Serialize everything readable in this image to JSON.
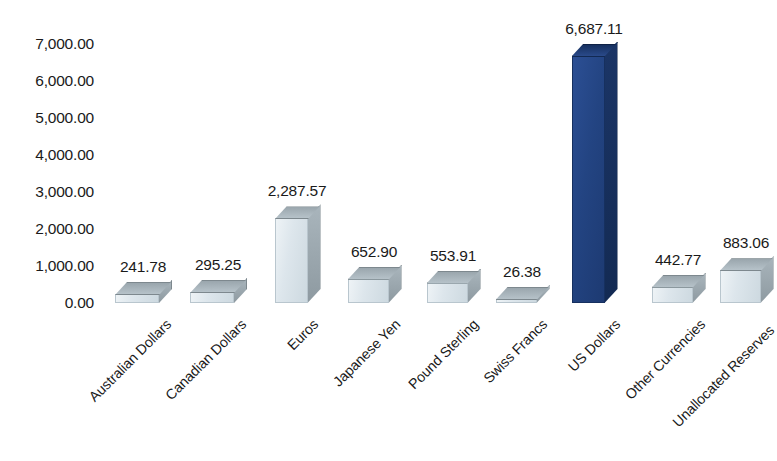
{
  "chart_data": {
    "type": "bar",
    "title": "",
    "subtitle": "",
    "xlabel": "",
    "ylabel": "",
    "ylim": [
      0,
      7000
    ],
    "y_tick_labels": [
      "7,000.00",
      "6,000.00",
      "5,000.00",
      "4,000.00",
      "3,000.00",
      "2,000.00",
      "1,000.00",
      "0.00"
    ],
    "y_tick_values": [
      7000,
      6000,
      5000,
      4000,
      3000,
      2000,
      1000,
      0
    ],
    "grid": false,
    "legend": "none",
    "categories": [
      "Australian Dollars",
      "Canadian Dollars",
      "Euros",
      "Japanese Yen",
      "Pound Sterling",
      "Swiss Francs",
      "US Dollars",
      "Other Currencies",
      "Unallocated Reserves"
    ],
    "values": [
      241.78,
      295.25,
      2287.57,
      652.9,
      553.91,
      26.38,
      6687.11,
      442.77,
      883.06
    ],
    "value_labels": [
      "241.78",
      "295.25",
      "2,287.57",
      "652.90",
      "553.91",
      "26.38",
      "6,687.11",
      "442.77",
      "883.06"
    ],
    "bar_colors": [
      "#dde6ec",
      "#dde6ec",
      "#dde6ec",
      "#dde6ec",
      "#dde6ec",
      "#dde6ec",
      "#234482",
      "#dde6ec",
      "#dde6ec"
    ],
    "highlight_index": 6,
    "highlight_color": "#234482",
    "default_color": "#dde6ec",
    "style": "3d-clustered-column"
  }
}
